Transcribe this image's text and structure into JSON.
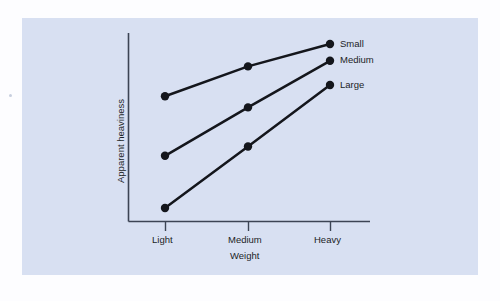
{
  "figure": {
    "panel_color": "#d8e0f2",
    "page_color": "#fdfdff",
    "ink_color": "#14161c",
    "axis_color": "#3c4454"
  },
  "chart_data": {
    "type": "line",
    "title": "",
    "subtitle": "",
    "xlabel": "Weight",
    "ylabel": "Apparent heaviness",
    "categories": [
      "Light",
      "Medium",
      "Heavy"
    ],
    "x": [
      1,
      2,
      3
    ],
    "xlim": [
      0.6,
      3.6
    ],
    "ylim": [
      0,
      100
    ],
    "grid": false,
    "legend_position": "right-of-endpoint",
    "axis_ticks_y": [],
    "series": [
      {
        "name": "Small",
        "label": "Small",
        "values": [
          72,
          88,
          100
        ],
        "marker": "filled-circle"
      },
      {
        "name": "Medium",
        "label": "Medium",
        "values": [
          40,
          66,
          91
        ],
        "marker": "filled-circle"
      },
      {
        "name": "Large",
        "label": "Large",
        "values": [
          12,
          45,
          78
        ],
        "marker": "filled-circle"
      }
    ],
    "annotations": [
      {
        "text": "Small",
        "attached_to": "Small",
        "at_point": "Heavy"
      },
      {
        "text": "Medium",
        "attached_to": "Medium",
        "at_point": "Heavy"
      },
      {
        "text": "Large",
        "attached_to": "Large",
        "at_point": "Heavy"
      }
    ]
  },
  "axis_labels": {
    "x_tick_1": "Light",
    "x_tick_2": "Medium",
    "x_tick_3": "Heavy",
    "x_title": "Weight",
    "y_title": "Apparent heaviness"
  },
  "legend": {
    "items": [
      {
        "label": "Small"
      },
      {
        "label": "Medium"
      },
      {
        "label": "Large"
      }
    ]
  }
}
